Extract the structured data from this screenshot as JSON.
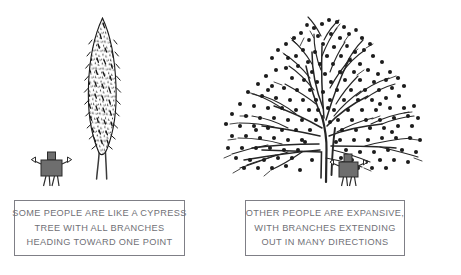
{
  "canvas": {
    "width": 461,
    "height": 275,
    "background": "#ffffff",
    "ink": "#1a1a1a",
    "figure_fill": "#6e6e6e",
    "figure_stroke": "#2b2b2b",
    "caption_border": "#7f7f86",
    "caption_text_color": "#6f7076"
  },
  "illustration": {
    "title": "two-tree-personality-comparison",
    "left_scene": {
      "name": "cypress-tree-scene",
      "tree_type": "cypress",
      "tree_description": "tall narrow columnar cypress tree with dense dark speckled foliage and a slender double trunk",
      "figure": "small gray robot person standing to the left of the trunk"
    },
    "right_scene": {
      "name": "spreading-tree-scene",
      "tree_type": "broad deciduous",
      "tree_description": "wide fan-shaped tree with many thin branches radiating outward, covered in small round dots representing buds or leaves",
      "figure": "small gray robot person standing at the base of the trunk"
    }
  },
  "captions": {
    "left": {
      "name": "cypress-caption",
      "lines": [
        "SOME PEOPLE ARE LIKE A CYPRESS",
        "TREE WITH ALL BRANCHES",
        "HEADING TOWARD ONE POINT"
      ],
      "line1": "SOME PEOPLE ARE LIKE A CYPRESS",
      "line2": "TREE WITH ALL BRANCHES",
      "line3": "HEADING TOWARD ONE POINT"
    },
    "right": {
      "name": "expansive-caption",
      "lines": [
        "OTHER PEOPLE ARE EXPANSIVE,",
        "WITH BRANCHES EXTENDING",
        "OUT IN MANY DIRECTIONS"
      ],
      "line1": "OTHER PEOPLE ARE EXPANSIVE,",
      "line2": "WITH BRANCHES EXTENDING",
      "line3": "OUT IN MANY DIRECTIONS"
    }
  }
}
